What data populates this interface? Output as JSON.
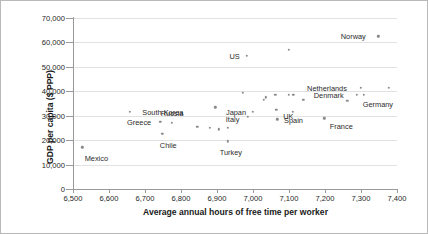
{
  "chart_data": {
    "type": "scatter",
    "title": "",
    "xlabel": "Average annual hours of free time per worker",
    "ylabel": "GDP per capita ($ PPP)",
    "xlim": [
      6500,
      7400
    ],
    "ylim": [
      0,
      70000
    ],
    "xticks": [
      "6,500",
      "6,600",
      "6,700",
      "6,800",
      "6,900",
      "7,000",
      "7,100",
      "7,200",
      "7,300",
      "7,400"
    ],
    "xtick_values": [
      6500,
      6600,
      6700,
      6800,
      6900,
      7000,
      7100,
      7200,
      7300,
      7400
    ],
    "yticks": [
      "0",
      "10,000",
      "20,000",
      "30,000",
      "40,000",
      "50,000",
      "60,000",
      "70,000"
    ],
    "ytick_values": [
      0,
      10000,
      20000,
      30000,
      40000,
      50000,
      60000,
      70000
    ],
    "grid": "horizontal",
    "legend": "none",
    "marker_color": "#8a8a8a",
    "points": [
      {
        "label": "Mexico",
        "x": 6526,
        "y": 17000,
        "label_dx": 14,
        "label_dy": 11
      },
      {
        "label": "South Korea",
        "x": 6658,
        "y": 31500,
        "label_dx": 33,
        "label_dy": 0
      },
      {
        "label": "Greece",
        "x": 6742,
        "y": 27500,
        "label_dx": -21,
        "label_dy": 0
      },
      {
        "label": "Russia",
        "x": 6775,
        "y": 27000,
        "label_dx": 0,
        "label_dy": -10
      },
      {
        "label": "Chile",
        "x": 6748,
        "y": 22500,
        "label_dx": 6,
        "label_dy": 11
      },
      {
        "label": "",
        "x": 6845,
        "y": 25500,
        "label_dx": 0,
        "label_dy": 0
      },
      {
        "label": "",
        "x": 6880,
        "y": 25000,
        "label_dx": 0,
        "label_dy": 0
      },
      {
        "label": "",
        "x": 6905,
        "y": 24500,
        "label_dx": 0,
        "label_dy": 0
      },
      {
        "label": "",
        "x": 6930,
        "y": 25000,
        "label_dx": 0,
        "label_dy": 0
      },
      {
        "label": "Turkey",
        "x": 6930,
        "y": 19500,
        "label_dx": 3,
        "label_dy": 11
      },
      {
        "label": "",
        "x": 6895,
        "y": 33500,
        "label_dx": 0,
        "label_dy": 0
      },
      {
        "label": "",
        "x": 6972,
        "y": 39500,
        "label_dx": 0,
        "label_dy": 0
      },
      {
        "label": "Italy",
        "x": 6985,
        "y": 29500,
        "label_dx": -15,
        "label_dy": 2
      },
      {
        "label": "Japan",
        "x": 7000,
        "y": 31500,
        "label_dx": -17,
        "label_dy": 0
      },
      {
        "label": "US",
        "x": 6982,
        "y": 54500,
        "label_dx": -12,
        "label_dy": 0
      },
      {
        "label": "",
        "x": 7035,
        "y": 37500,
        "label_dx": 0,
        "label_dy": 0
      },
      {
        "label": "",
        "x": 7030,
        "y": 36500,
        "label_dx": 0,
        "label_dy": 0
      },
      {
        "label": "",
        "x": 7062,
        "y": 38500,
        "label_dx": 0,
        "label_dy": 0
      },
      {
        "label": "UK",
        "x": 7065,
        "y": 32500,
        "label_dx": 12,
        "label_dy": 6
      },
      {
        "label": "Spain",
        "x": 7068,
        "y": 28500,
        "label_dx": 16,
        "label_dy": 1
      },
      {
        "label": "",
        "x": 7100,
        "y": 38500,
        "label_dx": 0,
        "label_dy": 0
      },
      {
        "label": "",
        "x": 7112,
        "y": 38500,
        "label_dx": 0,
        "label_dy": 0
      },
      {
        "label": "",
        "x": 7110,
        "y": 31500,
        "label_dx": 0,
        "label_dy": 0
      },
      {
        "label": "",
        "x": 7100,
        "y": 57000,
        "label_dx": 0,
        "label_dy": 0
      },
      {
        "label": "",
        "x": 7140,
        "y": 36500,
        "label_dx": 0,
        "label_dy": 0
      },
      {
        "label": "France",
        "x": 7198,
        "y": 29000,
        "label_dx": 17,
        "label_dy": 8
      },
      {
        "label": "Netherlands",
        "x": 7300,
        "y": 41500,
        "label_dx": -34,
        "label_dy": 0
      },
      {
        "label": "Denmark",
        "x": 7288,
        "y": 38500,
        "label_dx": -28,
        "label_dy": 0
      },
      {
        "label": "Germany",
        "x": 7308,
        "y": 38500,
        "label_dx": 14,
        "label_dy": 9
      },
      {
        "label": "",
        "x": 7262,
        "y": 36000,
        "label_dx": 0,
        "label_dy": 0
      },
      {
        "label": "",
        "x": 7378,
        "y": 41500,
        "label_dx": 0,
        "label_dy": 0
      },
      {
        "label": "Norway",
        "x": 7348,
        "y": 62500,
        "label_dx": -25,
        "label_dy": 0
      }
    ]
  }
}
